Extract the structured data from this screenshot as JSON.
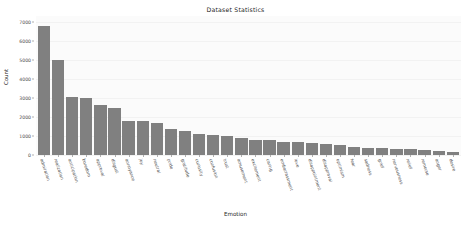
{
  "chart_data": {
    "type": "bar",
    "title": "Dataset Statistics",
    "xlabel": "Emotion",
    "ylabel": "Count",
    "ylim": [
      0,
      7300
    ],
    "yticks": [
      0,
      1000,
      2000,
      3000,
      4000,
      5000,
      6000,
      7000
    ],
    "ytick_labels": [
      "0",
      "1000",
      "2000",
      "3000",
      "4000",
      "5000",
      "6000",
      "7000"
    ],
    "grid": true,
    "legend": null,
    "bar_color": "#808080",
    "plot_background": "#fbfbfb",
    "categories": [
      "admiration",
      "realization",
      "anticipation",
      "boredom",
      "approval",
      "disgust",
      "annoyance",
      "joy",
      "neutral",
      "pride",
      "gratitude",
      "curiosity",
      "confusion",
      "trust",
      "amusement",
      "excitement",
      "caring",
      "embarrassment",
      "love",
      "disappointment",
      "disapproval",
      "optimism",
      "fear",
      "sadness",
      "grief",
      "nervousness",
      "relief",
      "remorse",
      "anger",
      "desire"
    ],
    "values": [
      6800,
      4980,
      3050,
      2990,
      2620,
      2450,
      1800,
      1800,
      1700,
      1350,
      1250,
      1100,
      1050,
      1000,
      870,
      770,
      770,
      680,
      660,
      650,
      570,
      550,
      430,
      370,
      350,
      300,
      290,
      250,
      200,
      150
    ]
  }
}
